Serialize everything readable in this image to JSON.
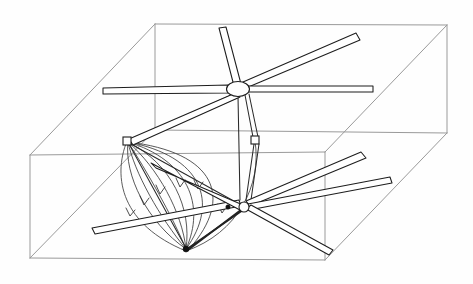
{
  "figure": {
    "title": "Hand-drawn 3D sketch of a dual-rotor mechanism inside a bounding box",
    "background_color": "#fefefe",
    "stroke_color_primary": "#1d1d1d",
    "stroke_color_box": "#9a9a9a",
    "stroke_color_flow": "#3a3a3a"
  },
  "bounding_box": {
    "name": "wireframe-box",
    "visible_edges": 12,
    "vertices": {
      "front_top_left": [
        30,
        155
      ],
      "front_top_right": [
        325,
        152
      ],
      "front_bottom_left": [
        30,
        258
      ],
      "front_bottom_right": [
        325,
        260
      ],
      "back_top_left": [
        155,
        24
      ],
      "back_top_right": [
        447,
        25
      ],
      "back_bottom_left": [
        155,
        130
      ],
      "back_bottom_right": [
        447,
        133
      ]
    }
  },
  "upper_rotor": {
    "name": "upper-hub",
    "hub_center": [
      238,
      89
    ],
    "hub_rx": 11,
    "hub_ry": 7,
    "blade_count": 5,
    "blade_tips": [
      [
        103,
        91
      ],
      [
        222,
        28
      ],
      [
        358,
        37
      ],
      [
        373,
        88
      ],
      [
        128,
        142
      ]
    ]
  },
  "lower_rotor": {
    "name": "lower-hub",
    "hub_center": [
      244,
      208
    ],
    "blade_count": 5,
    "blade_tips": [
      [
        92,
        231
      ],
      [
        152,
        166
      ],
      [
        364,
        155
      ],
      [
        391,
        180
      ],
      [
        331,
        253
      ]
    ]
  },
  "frame": {
    "name": "structural-frame",
    "nodes": {
      "left_vertex": [
        127,
        141
      ],
      "upper_hub": [
        238,
        89
      ],
      "right_upper": [
        255,
        140
      ],
      "right_lower": [
        248,
        200
      ],
      "lower_hub": [
        244,
        208
      ],
      "bottom_vertex": [
        186,
        249
      ]
    }
  },
  "flow_field": {
    "name": "converging-arrow-fan",
    "origin_vertex": [
      127,
      141
    ],
    "target_vertex": [
      186,
      249
    ],
    "arrow_count": 6,
    "curve_count": 8,
    "direction": "downward-converging"
  },
  "labels": {
    "figure_caption": "",
    "axis_labels": [],
    "annotations": []
  }
}
